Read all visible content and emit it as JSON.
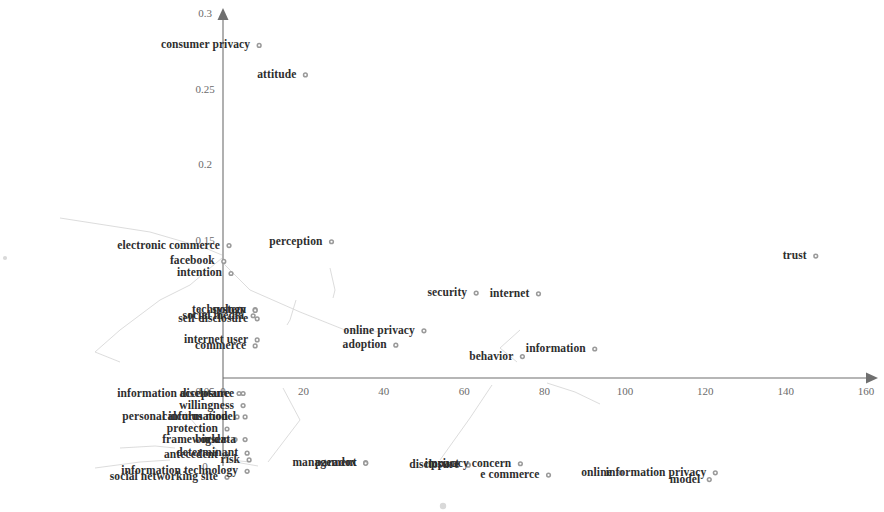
{
  "chart_data": {
    "type": "scatter",
    "title": "",
    "subtitle": "",
    "xlabel": "",
    "ylabel": "",
    "xlim": [
      0,
      160
    ],
    "ylim": [
      0,
      0.3
    ],
    "xticks": [
      0,
      20,
      40,
      60,
      80,
      100,
      120,
      140,
      160
    ],
    "xtick_labels": [
      "0",
      "20",
      "40",
      "60",
      "80",
      "100",
      "120",
      "140",
      "160"
    ],
    "yticks": [
      0,
      0.05,
      0.1,
      0.15,
      0.2,
      0.25,
      0.3
    ],
    "ytick_labels": [
      "0",
      "0.05",
      "0.1",
      "0.15",
      "0.2",
      "0.25",
      "0.3"
    ],
    "grid": false,
    "legend": "none",
    "marker_color": "#9a9a9a",
    "axis_color": "#6f6f6f",
    "label_color": "#2e2e2e",
    "points": [
      {
        "label": "consumer privacy",
        "x": 9.0,
        "y": 0.2785,
        "label_side": "left"
      },
      {
        "label": "attitude",
        "x": 20.5,
        "y": 0.259,
        "label_side": "left"
      },
      {
        "label": "electronic commerce",
        "x": 1.5,
        "y": 0.146,
        "label_side": "left"
      },
      {
        "label": "perception",
        "x": 27.0,
        "y": 0.1485,
        "label_side": "left"
      },
      {
        "label": "trust",
        "x": 147.5,
        "y": 0.139,
        "label_side": "left"
      },
      {
        "label": "facebook",
        "x": 0.2,
        "y": 0.1355,
        "label_side": "left"
      },
      {
        "label": "intention",
        "x": 2.0,
        "y": 0.1275,
        "label_side": "left"
      },
      {
        "label": "security",
        "x": 63.0,
        "y": 0.1145,
        "label_side": "left"
      },
      {
        "label": "internet",
        "x": 78.5,
        "y": 0.114,
        "label_side": "left"
      },
      {
        "label": "technology",
        "x": 8.0,
        "y": 0.1035,
        "label_side": "left"
      },
      {
        "label": "system",
        "x": 8.0,
        "y": 0.103,
        "label_side": "left"
      },
      {
        "label": "social media",
        "x": 7.5,
        "y": 0.0995,
        "label_side": "left"
      },
      {
        "label": "self disclosure",
        "x": 8.5,
        "y": 0.0975,
        "label_side": "left"
      },
      {
        "label": "information",
        "x": 92.5,
        "y": 0.0775,
        "label_side": "left"
      },
      {
        "label": "online privacy",
        "x": 50.0,
        "y": 0.0895,
        "label_side": "left"
      },
      {
        "label": "internet user",
        "x": 8.5,
        "y": 0.0835,
        "label_side": "left"
      },
      {
        "label": "adoption",
        "x": 43.0,
        "y": 0.08,
        "label_side": "left"
      },
      {
        "label": "commerce",
        "x": 8.0,
        "y": 0.0795,
        "label_side": "left"
      },
      {
        "label": "behavior",
        "x": 74.5,
        "y": 0.0725,
        "label_side": "left"
      },
      {
        "label": "acceptance",
        "x": 5.0,
        "y": 0.048,
        "label_side": "left"
      },
      {
        "label": "information disclosure",
        "x": 4.0,
        "y": 0.048,
        "label_side": "left"
      },
      {
        "label": "willingness",
        "x": 5.0,
        "y": 0.04,
        "label_side": "left"
      },
      {
        "label": "calculus model",
        "x": 5.5,
        "y": 0.0325,
        "label_side": "left"
      },
      {
        "label": "personal information",
        "x": 3.5,
        "y": 0.0325,
        "label_side": "left"
      },
      {
        "label": "protection",
        "x": 1.0,
        "y": 0.0245,
        "label_side": "left"
      },
      {
        "label": "big data",
        "x": 5.5,
        "y": 0.0175,
        "label_side": "left"
      },
      {
        "label": "user",
        "x": 3.0,
        "y": 0.0175,
        "label_side": "left"
      },
      {
        "label": "framework",
        "x": 1.0,
        "y": 0.0175,
        "label_side": "left"
      },
      {
        "label": "determinant",
        "x": 6.0,
        "y": 0.0085,
        "label_side": "left"
      },
      {
        "label": "antecedent",
        "x": 1.0,
        "y": 0.0075,
        "label_side": "left"
      },
      {
        "label": "risk",
        "x": 6.5,
        "y": 0.004,
        "label_side": "left"
      },
      {
        "label": "information technology",
        "x": 6.0,
        "y": -0.0035,
        "label_side": "left"
      },
      {
        "label": "social networking site",
        "x": 1.0,
        "y": -0.0075,
        "label_side": "left"
      },
      {
        "label": "paradox",
        "x": 35.5,
        "y": 0.0022,
        "label_side": "left"
      },
      {
        "label": "management",
        "x": 35.5,
        "y": 0.0018,
        "label_side": "left"
      },
      {
        "label": "impact",
        "x": 61.0,
        "y": 0.001,
        "label_side": "left"
      },
      {
        "label": "disclosure",
        "x": 61.0,
        "y": 0.0005,
        "label_side": "left"
      },
      {
        "label": "privacy concern",
        "x": 74.0,
        "y": 0.0015,
        "label_side": "left"
      },
      {
        "label": "e commerce",
        "x": 81.0,
        "y": -0.006,
        "label_side": "left"
      },
      {
        "label": "online",
        "x": 99.0,
        "y": -0.0045,
        "label_side": "left"
      },
      {
        "label": "information privacy",
        "x": 122.5,
        "y": -0.0045,
        "label_side": "left"
      },
      {
        "label": "model",
        "x": 121.0,
        "y": -0.009,
        "label_side": "left"
      }
    ]
  },
  "axes": {
    "x_axis_name": "x-axis",
    "y_axis_name": "y-axis",
    "x_tick_values": [
      "0",
      "20",
      "40",
      "60",
      "80",
      "100",
      "120",
      "140",
      "160"
    ],
    "y_tick_values": [
      "0",
      "0.05",
      "0.1",
      "0.15",
      "0.2",
      "0.25",
      "0.3"
    ]
  }
}
